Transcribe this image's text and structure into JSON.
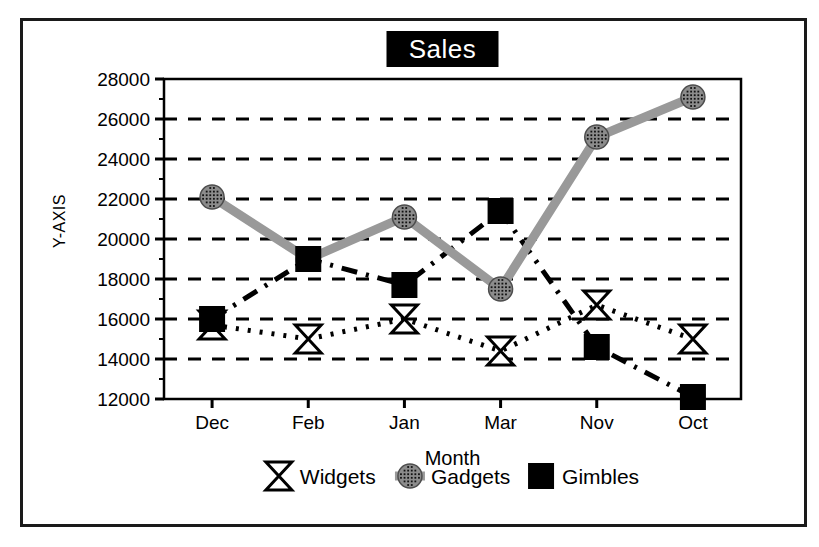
{
  "figure": {
    "frame_border_color": "#1a1a1a",
    "background": "#ffffff"
  },
  "chart_data": {
    "type": "line",
    "title": "Sales",
    "xlabel": "Month",
    "ylabel": "Y-AXIS",
    "categories": [
      "Dec",
      "Feb",
      "Jan",
      "Mar",
      "Nov",
      "Oct"
    ],
    "ylim": [
      12000,
      28000
    ],
    "ytick_values": [
      12000,
      14000,
      16000,
      18000,
      20000,
      22000,
      24000,
      26000,
      28000
    ],
    "ytick_labels": [
      "12000",
      "14000",
      "16000",
      "18000",
      "20000",
      "22000",
      "24000",
      "26000",
      "28000"
    ],
    "grid": true,
    "grid_style": "dashed",
    "legend_position": "bottom",
    "series": [
      {
        "name": "Widgets",
        "marker": "bowtie",
        "marker_fill": "#ffffff",
        "line_color": "#000000",
        "line_style": "dotted",
        "values": [
          15700,
          15000,
          16000,
          14400,
          16700,
          15000
        ]
      },
      {
        "name": "Gadgets",
        "marker": "circle",
        "marker_fill": "#8c8c8c",
        "line_color": "#999999",
        "line_style": "solid",
        "values": [
          22100,
          19000,
          21100,
          17500,
          25100,
          27100
        ]
      },
      {
        "name": "Gimbles",
        "marker": "square",
        "marker_fill": "#000000",
        "line_color": "#000000",
        "line_style": "dashdot",
        "values": [
          16000,
          19000,
          17700,
          21400,
          14600,
          12100
        ]
      }
    ]
  }
}
